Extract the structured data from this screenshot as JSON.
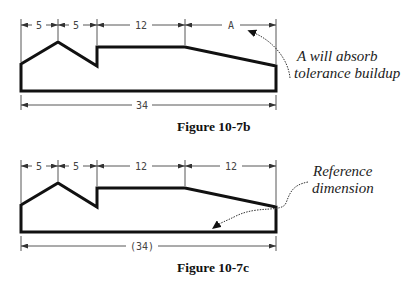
{
  "figures": [
    {
      "id": "10-7b",
      "caption": "Figure 10-7b",
      "dimensions": {
        "seg1": "5",
        "seg2": "5",
        "seg3": "12",
        "seg4": "A",
        "overall": "34"
      },
      "note": {
        "line1": "A will absorb",
        "line2": "tolerance buildup"
      }
    },
    {
      "id": "10-7c",
      "caption": "Figure 10-7c",
      "dimensions": {
        "seg1": "5",
        "seg2": "5",
        "seg3": "12",
        "seg4": "12",
        "overall": "(34)"
      },
      "note": {
        "line1": "Reference",
        "line2": "dimension"
      }
    }
  ]
}
